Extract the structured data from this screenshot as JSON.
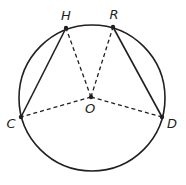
{
  "diagram": {
    "type": "circle-geometry",
    "circle": {
      "center_label": "O",
      "cx": 92,
      "cy": 98,
      "r": 73
    },
    "points": [
      {
        "id": "H",
        "label": "H",
        "x": 66,
        "y": 28,
        "lx": 66,
        "ly": 20
      },
      {
        "id": "R",
        "label": "R",
        "x": 113,
        "y": 27,
        "lx": 114,
        "ly": 19
      },
      {
        "id": "O",
        "label": "O",
        "x": 91,
        "y": 97,
        "lx": 90,
        "ly": 113
      },
      {
        "id": "C",
        "label": "C",
        "x": 21,
        "y": 117,
        "lx": 11,
        "ly": 128
      },
      {
        "id": "D",
        "label": "D",
        "x": 162,
        "y": 117,
        "lx": 172,
        "ly": 128
      }
    ],
    "solid_segments": [
      {
        "from": "C",
        "to": "H"
      },
      {
        "from": "R",
        "to": "D"
      }
    ],
    "dashed_segments": [
      {
        "from": "O",
        "to": "H"
      },
      {
        "from": "O",
        "to": "R"
      },
      {
        "from": "O",
        "to": "C"
      },
      {
        "from": "O",
        "to": "D"
      }
    ],
    "colors": {
      "stroke": "#231f20",
      "background": "#ffffff"
    }
  }
}
